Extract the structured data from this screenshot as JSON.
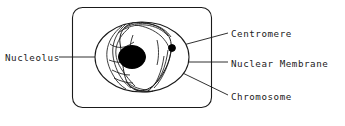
{
  "figure": {
    "type": "biology-diagram",
    "background_color": "#ffffff",
    "stroke_color": "#1a1a1a",
    "fill_color": "#000000"
  },
  "labels": {
    "nucleolus": "Nucleolus",
    "centromere": "Centromere",
    "nuclear_membrane": "Nuclear Membrane",
    "chromosome": "Chromosome"
  },
  "structures": {
    "cell_boundary": "rounded-rectangle",
    "nuclear_membrane": "ellipse",
    "nucleolus": "filled-ellipse",
    "centromere": "filled-dot",
    "chromosome": "squiggly-threads"
  }
}
